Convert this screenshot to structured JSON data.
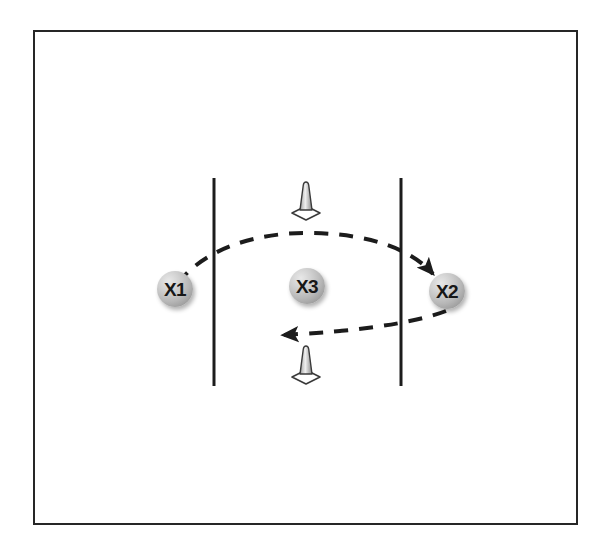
{
  "diagram": {
    "background_color": "#ffffff",
    "frame": {
      "border_color": "#262626",
      "border_width_px": 2,
      "x": 33,
      "y": 30,
      "width": 545,
      "height": 495
    },
    "players": [
      {
        "id": "x1",
        "label": "X1",
        "cx": 175,
        "cy": 289,
        "radius": 18,
        "fill": "#b7b7b7",
        "text_color": "#171717"
      },
      {
        "id": "x2",
        "label": "X2",
        "cx": 447,
        "cy": 291,
        "radius": 18,
        "fill": "#b7b7b7",
        "text_color": "#171717"
      },
      {
        "id": "x3",
        "label": "X3",
        "cx": 307,
        "cy": 286,
        "radius": 18,
        "fill": "#b7b7b7",
        "text_color": "#171717"
      }
    ],
    "boundary_lines": [
      {
        "id": "left-lane-line",
        "x": 214,
        "y1": 178,
        "y2": 386,
        "color": "#1c1c1c",
        "width_px": 3
      },
      {
        "id": "right-lane-line",
        "x": 401,
        "y1": 178,
        "y2": 386,
        "color": "#1c1c1c",
        "width_px": 3
      }
    ],
    "cones": [
      {
        "id": "cone-top",
        "cx": 306,
        "cy": 201,
        "color": "#b0b0b0",
        "outline": "#3a3a3a"
      },
      {
        "id": "cone-bottom",
        "cx": 306,
        "cy": 365,
        "color": "#b0b0b0",
        "outline": "#3a3a3a"
      }
    ],
    "movement_arrows": [
      {
        "id": "pass-arc-x1-to-x2",
        "style": "dashed",
        "from": "X1",
        "to": "X2",
        "color": "#1c1c1c",
        "width_px": 4,
        "dash_pattern": "14 11",
        "arrowhead": "filled-triangle",
        "arrowhead_at": "end"
      },
      {
        "id": "pass-arc-x2-to-left",
        "style": "dashed",
        "from": "X2",
        "to": "left of X3",
        "color": "#1c1c1c",
        "width_px": 4,
        "dash_pattern": "14 11",
        "arrowhead": "filled-triangle",
        "arrowhead_at": "end"
      }
    ]
  }
}
